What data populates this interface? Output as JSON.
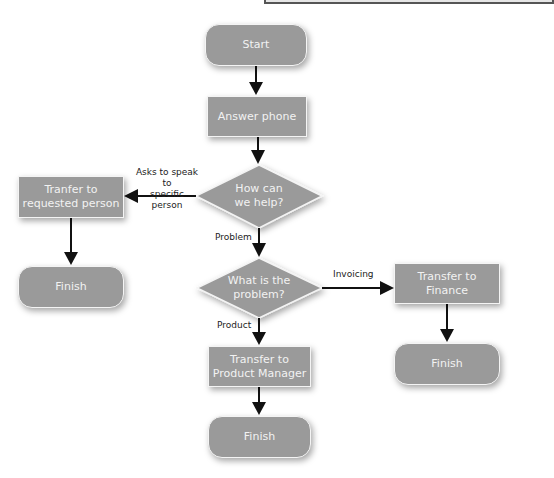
{
  "diagram": {
    "type": "flowchart",
    "nodes": {
      "start": {
        "label": "Start",
        "shape": "terminal"
      },
      "answer": {
        "label": "Answer phone",
        "shape": "process"
      },
      "help": {
        "label_line1": "How can",
        "label_line2": "we help?",
        "shape": "decision"
      },
      "tranfer": {
        "label_line1": "Tranfer to",
        "label_line2": "requested person",
        "shape": "process"
      },
      "finish_left": {
        "label": "Finish",
        "shape": "terminal"
      },
      "problem": {
        "label_line1": "What is the",
        "label_line2": "problem?",
        "shape": "decision"
      },
      "finance": {
        "label": "Transfer to Finance",
        "shape": "process"
      },
      "finish_right": {
        "label": "Finish",
        "shape": "terminal"
      },
      "product": {
        "label_line1": "Transfer to",
        "label_line2": "Product Manager",
        "shape": "process"
      },
      "finish_bottom": {
        "label": "Finish",
        "shape": "terminal"
      }
    },
    "edges": {
      "help_to_tranfer": {
        "label_line1": "Asks to speak to",
        "label_line2": "specific person"
      },
      "help_to_problem": {
        "label": "Problem"
      },
      "problem_to_finance": {
        "label": "Invoicing"
      },
      "problem_to_product": {
        "label": "Product"
      }
    },
    "colors": {
      "node_fill": "#9a9a9a",
      "node_border": "#f4f4f4",
      "node_text": "#f2f2f2",
      "arrow": "#111111",
      "edge_label": "#222222"
    }
  }
}
